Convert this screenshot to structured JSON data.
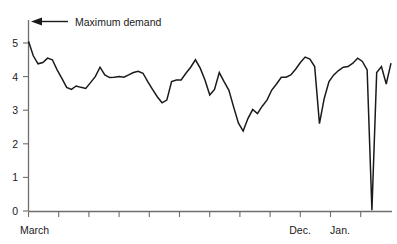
{
  "chart_data": {
    "type": "line",
    "title": "",
    "subtitle": "",
    "xlabel": "",
    "ylabel": "",
    "ylim": [
      0,
      5.4
    ],
    "xlim": [
      0,
      76
    ],
    "grid": false,
    "legend_position": "none",
    "y_ticks": [
      0,
      1,
      2,
      3,
      4,
      5
    ],
    "y_tick_labels": [
      "0",
      "1",
      "2",
      "3",
      "4",
      "5"
    ],
    "x_tick_count": 12,
    "x_tick_labels_shown": [
      "March",
      "Dec.",
      "Jan."
    ],
    "annotations": [
      {
        "text": "Maximum demand",
        "arrow": "left",
        "target_value": 5.05
      }
    ],
    "series": [
      {
        "name": "Maximum demand",
        "color": "#1a1a1a",
        "x": [
          0,
          1,
          2,
          3,
          4,
          5,
          6,
          7,
          8,
          9,
          10,
          11,
          12,
          13,
          14,
          15,
          16,
          17,
          18,
          19,
          20,
          21,
          22,
          23,
          24,
          25,
          26,
          27,
          28,
          29,
          30,
          31,
          32,
          33,
          34,
          35,
          36,
          37,
          38,
          39,
          40,
          41,
          42,
          43,
          44,
          45,
          46,
          47,
          48,
          49,
          50,
          51,
          52,
          53,
          54,
          55,
          56,
          57,
          58,
          59,
          60,
          61,
          62,
          63,
          64,
          65,
          66,
          67,
          68,
          69,
          70,
          71,
          72,
          73,
          74,
          75,
          76
        ],
        "values": [
          5.05,
          4.62,
          4.38,
          4.42,
          4.55,
          4.5,
          4.2,
          3.95,
          3.68,
          3.62,
          3.72,
          3.68,
          3.65,
          3.82,
          4.0,
          4.28,
          4.05,
          3.97,
          3.98,
          4.0,
          3.98,
          4.05,
          4.12,
          4.16,
          4.1,
          3.85,
          3.62,
          3.4,
          3.22,
          3.3,
          3.85,
          3.9,
          3.9,
          4.1,
          4.28,
          4.5,
          4.25,
          3.9,
          3.45,
          3.62,
          4.12,
          3.85,
          3.6,
          3.1,
          2.62,
          2.38,
          2.75,
          3.02,
          2.9,
          3.12,
          3.3,
          3.6,
          3.78,
          3.98,
          3.98,
          4.05,
          4.22,
          4.42,
          4.58,
          4.52,
          4.3,
          2.6,
          3.35,
          3.85,
          4.05,
          4.18,
          4.28,
          4.3,
          4.4,
          4.55,
          4.45,
          4.2,
          0.02,
          4.12,
          4.3,
          3.78,
          4.4
        ],
        "min": 0.02,
        "max": 5.05
      }
    ]
  },
  "axis": {
    "y_label_0": "0",
    "y_label_1": "1",
    "y_label_2": "2",
    "y_label_3": "3",
    "y_label_4": "4",
    "y_label_5": "5",
    "x_label_start": "March",
    "x_label_dec": "Dec.",
    "x_label_jan": "Jan."
  },
  "annotation": {
    "label": "Maximum demand"
  },
  "colors": {
    "line": "#1a1a1a",
    "axis": "#6e6e6e",
    "text": "#1a1a1a",
    "background": "#ffffff"
  }
}
